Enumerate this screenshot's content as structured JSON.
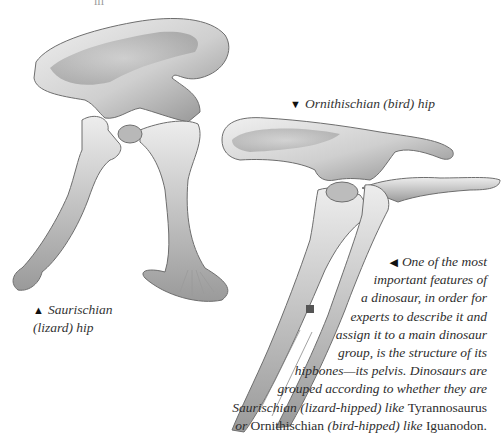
{
  "top_fragment": "ııı",
  "figures": {
    "ornithischian": {
      "marker": "▼",
      "caption": "Ornithischian (bird) hip"
    },
    "saurischian": {
      "marker": "▲",
      "caption_line1": "Saurischian",
      "caption_line2": "(lizard) hip"
    }
  },
  "body_text": {
    "marker": "◀",
    "lines": [
      "One of the most",
      "important features of",
      "a dinosaur, in order for",
      "experts to describe it and",
      "assign it to a main dinosaur",
      "group, is the structure of its",
      "hipbones—its pelvis. Dinosaurs are",
      "grouped according to whether they are"
    ],
    "line9": {
      "a": "Saurischian (lizard-hipped) like ",
      "b": "Tyrannosaurus"
    },
    "line10": {
      "a": "or ",
      "b": "Ornithischian ",
      "c": "(bird-hipped) like ",
      "d": "Iguanodon."
    }
  },
  "colors": {
    "bone_light": "#e6e6e6",
    "bone_mid": "#bdbdbd",
    "bone_dark": "#7a7a7a",
    "background": "#ffffff"
  }
}
